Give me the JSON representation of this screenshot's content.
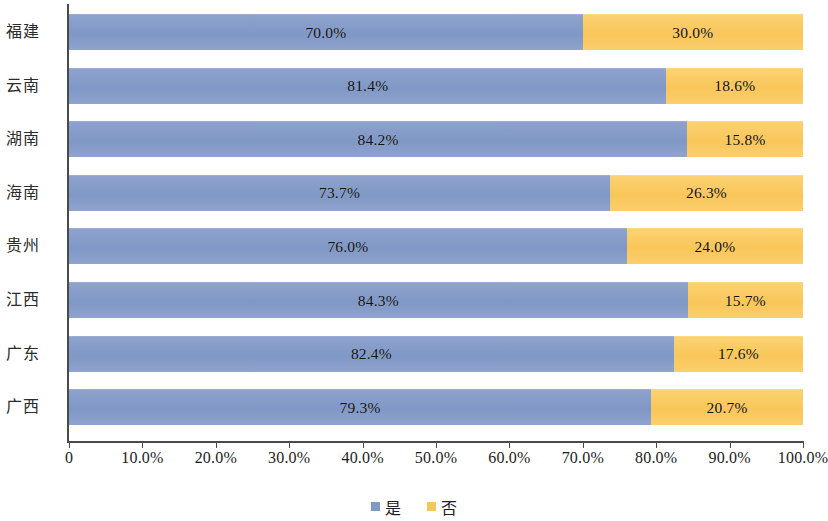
{
  "chart_data": {
    "type": "bar",
    "orientation": "horizontal",
    "stacked": true,
    "stacked_normalized": true,
    "title": "",
    "subtitle": "",
    "xlabel": "",
    "ylabel": "",
    "xlim": [
      0,
      100
    ],
    "ylim": null,
    "grid": false,
    "legend_position": "bottom-center",
    "categories": [
      "福建",
      "云南",
      "湖南",
      "海南",
      "贵州",
      "江西",
      "广东",
      "广西"
    ],
    "xticks": [
      0,
      10,
      20,
      30,
      40,
      50,
      60,
      70,
      80,
      90,
      100
    ],
    "xtick_labels": [
      "0",
      "10.0%",
      "20.0%",
      "30.0%",
      "40.0%",
      "50.0%",
      "60.0%",
      "70.0%",
      "80.0%",
      "90.0%",
      "100.0%"
    ],
    "series": [
      {
        "name": "是",
        "color": "#8099c6",
        "values": [
          70.0,
          81.4,
          84.2,
          73.7,
          76.0,
          84.3,
          82.4,
          79.3
        ],
        "labels": [
          "70.0%",
          "81.4%",
          "84.2%",
          "73.7%",
          "76.0%",
          "84.3%",
          "82.4%",
          "79.3%"
        ]
      },
      {
        "name": "否",
        "color": "#f9c65a",
        "values": [
          30.0,
          18.6,
          15.8,
          26.3,
          24.0,
          15.7,
          17.6,
          20.7
        ],
        "labels": [
          "30.0%",
          "18.6%",
          "15.8%",
          "26.3%",
          "24.0%",
          "15.7%",
          "17.6%",
          "20.7%"
        ]
      }
    ],
    "rows": [
      {
        "category": "福建",
        "yes": 70.0,
        "no": 30.0,
        "yes_label": "70.0%",
        "no_label": "30.0%"
      },
      {
        "category": "云南",
        "yes": 81.4,
        "no": 18.6,
        "yes_label": "81.4%",
        "no_label": "18.6%"
      },
      {
        "category": "湖南",
        "yes": 84.2,
        "no": 15.8,
        "yes_label": "84.2%",
        "no_label": "15.8%"
      },
      {
        "category": "海南",
        "yes": 73.7,
        "no": 26.3,
        "yes_label": "73.7%",
        "no_label": "26.3%"
      },
      {
        "category": "贵州",
        "yes": 76.0,
        "no": 24.0,
        "yes_label": "76.0%",
        "no_label": "24.0%"
      },
      {
        "category": "江西",
        "yes": 84.3,
        "no": 15.7,
        "yes_label": "84.3%",
        "no_label": "15.7%"
      },
      {
        "category": "广东",
        "yes": 82.4,
        "no": 17.6,
        "yes_label": "82.4%",
        "no_label": "17.6%"
      },
      {
        "category": "广西",
        "yes": 79.3,
        "no": 20.7,
        "yes_label": "79.3%",
        "no_label": "20.7%"
      }
    ]
  },
  "legend": {
    "items": [
      {
        "label": "是",
        "color": "#8099c6"
      },
      {
        "label": "否",
        "color": "#f9c65a"
      }
    ]
  },
  "colors": {
    "series_yes": "#8099c6",
    "series_no": "#f9c65a",
    "axis": "#4a4a4a",
    "text": "#1a1a1a",
    "background": "#ffffff"
  }
}
